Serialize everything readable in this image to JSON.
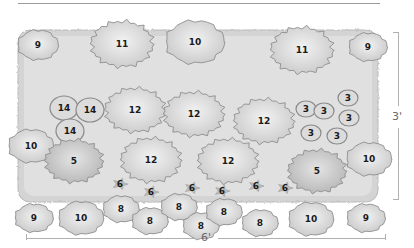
{
  "diagram": {
    "colors": {
      "bed_fill": "#d8d8d8",
      "plant_fill": "#e6e6e6",
      "plant_edge": "#8f8f8f",
      "label_text": "#1a1a1a",
      "dimension_line": "#b0b0b0"
    },
    "dimensions": {
      "width_label": "6'",
      "height_label": "3'"
    },
    "plants": [
      {
        "id": "9",
        "x": 38,
        "y": 15,
        "r": 18,
        "shape": "round"
      },
      {
        "id": "11",
        "x": 122,
        "y": 14,
        "r": 28,
        "shape": "spiky"
      },
      {
        "id": "10",
        "x": 195,
        "y": 12,
        "r": 26,
        "shape": "soft"
      },
      {
        "id": "11",
        "x": 302,
        "y": 20,
        "r": 28,
        "shape": "spiky"
      },
      {
        "id": "9",
        "x": 368,
        "y": 17,
        "r": 17,
        "shape": "round"
      },
      {
        "id": "14",
        "x": 64,
        "y": 78,
        "r": 12,
        "shape": "ring"
      },
      {
        "id": "14",
        "x": 90,
        "y": 80,
        "r": 12,
        "shape": "ring"
      },
      {
        "id": "14",
        "x": 70,
        "y": 101,
        "r": 12,
        "shape": "ring"
      },
      {
        "id": "12",
        "x": 135,
        "y": 80,
        "r": 27,
        "shape": "spiky"
      },
      {
        "id": "12",
        "x": 194,
        "y": 84,
        "r": 27,
        "shape": "spiky"
      },
      {
        "id": "12",
        "x": 264,
        "y": 91,
        "r": 27,
        "shape": "spiky"
      },
      {
        "id": "3",
        "x": 306,
        "y": 79,
        "r": 8,
        "shape": "ring"
      },
      {
        "id": "3",
        "x": 324,
        "y": 81,
        "r": 8,
        "shape": "ring"
      },
      {
        "id": "3",
        "x": 348,
        "y": 68,
        "r": 8,
        "shape": "ring"
      },
      {
        "id": "3",
        "x": 349,
        "y": 88,
        "r": 8,
        "shape": "ring"
      },
      {
        "id": "3",
        "x": 311,
        "y": 103,
        "r": 8,
        "shape": "ring"
      },
      {
        "id": "3",
        "x": 337,
        "y": 106,
        "r": 8,
        "shape": "ring"
      },
      {
        "id": "10",
        "x": 31,
        "y": 116,
        "r": 20,
        "shape": "soft"
      },
      {
        "id": "5",
        "x": 74,
        "y": 131,
        "r": 26,
        "shape": "spiky-dark"
      },
      {
        "id": "12",
        "x": 151,
        "y": 130,
        "r": 27,
        "shape": "spiky"
      },
      {
        "id": "12",
        "x": 228,
        "y": 131,
        "r": 27,
        "shape": "spiky"
      },
      {
        "id": "5",
        "x": 317,
        "y": 141,
        "r": 26,
        "shape": "spiky-dark"
      },
      {
        "id": "10",
        "x": 369,
        "y": 129,
        "r": 20,
        "shape": "soft"
      },
      {
        "id": "6",
        "x": 120,
        "y": 154,
        "r": 7,
        "shape": "star"
      },
      {
        "id": "6",
        "x": 151,
        "y": 162,
        "r": 7,
        "shape": "star"
      },
      {
        "id": "6",
        "x": 192,
        "y": 158,
        "r": 7,
        "shape": "star"
      },
      {
        "id": "6",
        "x": 222,
        "y": 161,
        "r": 7,
        "shape": "star"
      },
      {
        "id": "6",
        "x": 256,
        "y": 156,
        "r": 7,
        "shape": "star"
      },
      {
        "id": "6",
        "x": 285,
        "y": 158,
        "r": 7,
        "shape": "star"
      },
      {
        "id": "9",
        "x": 34,
        "y": 188,
        "r": 17,
        "shape": "round"
      },
      {
        "id": "10",
        "x": 81,
        "y": 188,
        "r": 20,
        "shape": "soft"
      },
      {
        "id": "8",
        "x": 121,
        "y": 179,
        "r": 16,
        "shape": "round"
      },
      {
        "id": "8",
        "x": 150,
        "y": 191,
        "r": 16,
        "shape": "round"
      },
      {
        "id": "8",
        "x": 179,
        "y": 177,
        "r": 16,
        "shape": "round"
      },
      {
        "id": "8",
        "x": 201,
        "y": 196,
        "r": 16,
        "shape": "round"
      },
      {
        "id": "8",
        "x": 224,
        "y": 182,
        "r": 16,
        "shape": "round"
      },
      {
        "id": "8",
        "x": 260,
        "y": 193,
        "r": 16,
        "shape": "round"
      },
      {
        "id": "10",
        "x": 311,
        "y": 189,
        "r": 20,
        "shape": "soft"
      },
      {
        "id": "9",
        "x": 366,
        "y": 188,
        "r": 17,
        "shape": "round"
      }
    ]
  }
}
